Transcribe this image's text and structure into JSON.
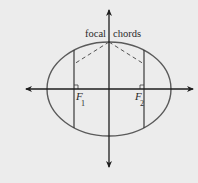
{
  "diagram": {
    "type": "ellipse-focal-chords",
    "colors": {
      "background": "#ececec",
      "ellipse": "#5a5a5a",
      "axes": "#1e1e1e",
      "chords": "#3a3a3a",
      "dashed": "#555555"
    },
    "labels": {
      "focal": "focal",
      "chords": "chords",
      "f1_letter": "F",
      "f1_sub": "1",
      "f2_letter": "F",
      "f2_sub": "2"
    }
  }
}
